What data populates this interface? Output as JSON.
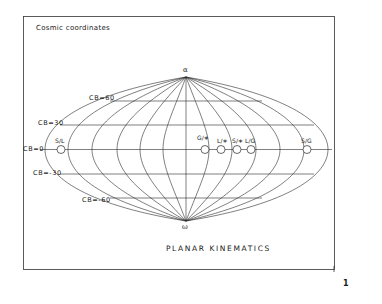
{
  "figure": {
    "title": "Cosmic coordinates",
    "caption": "PLANAR KINEMATICS",
    "page_number": "1",
    "poles": {
      "top": "α",
      "bottom": "ω"
    },
    "latitude_labels": [
      {
        "label": "CB=60",
        "value": 60
      },
      {
        "label": "CB=30",
        "value": 30
      },
      {
        "label": "CB=0",
        "value": 0
      },
      {
        "label": "CB=-30",
        "value": -30
      },
      {
        "label": "CB=-60",
        "value": -60
      }
    ],
    "points": [
      {
        "label": "S/L"
      },
      {
        "label": "G/∗"
      },
      {
        "label": "L/∗"
      },
      {
        "label": "S/∗"
      },
      {
        "label": "L/G"
      },
      {
        "label": "S/G"
      }
    ],
    "colors": {
      "line": "#2a2a2a",
      "background": "#ffffff",
      "frame": "#333333"
    }
  }
}
